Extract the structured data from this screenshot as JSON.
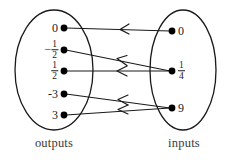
{
  "diagram": {
    "type": "mapping-diagram",
    "title": "",
    "colors": {
      "stroke": "#1a1a1a",
      "node_fill": "#000000",
      "caption": "#3a3a3a",
      "background": "#ffffff"
    },
    "sets": {
      "left": {
        "caption": "outputs",
        "ellipse": {
          "cx": 54,
          "cy": 70,
          "rx": 39,
          "ry": 60
        },
        "nodes": [
          {
            "id": "out-0",
            "label": "0",
            "is_fraction": false,
            "negative": false,
            "x": 64,
            "y": 28
          },
          {
            "id": "out-neghalf",
            "label": "-1/2",
            "is_fraction": true,
            "negative": true,
            "numerator": "1",
            "denominator": "2",
            "x": 64,
            "y": 50
          },
          {
            "id": "out-half",
            "label": "1/2",
            "is_fraction": true,
            "negative": false,
            "numerator": "1",
            "denominator": "2",
            "x": 64,
            "y": 71
          },
          {
            "id": "out-neg3",
            "label": "-3",
            "is_fraction": false,
            "negative": true,
            "x": 64,
            "y": 94
          },
          {
            "id": "out-3",
            "label": "3",
            "is_fraction": false,
            "negative": false,
            "x": 64,
            "y": 115
          }
        ]
      },
      "right": {
        "caption": "inputs",
        "ellipse": {
          "cx": 183,
          "cy": 70,
          "rx": 33,
          "ry": 60
        },
        "nodes": [
          {
            "id": "in-0",
            "label": "0",
            "is_fraction": false,
            "negative": false,
            "x": 172,
            "y": 31
          },
          {
            "id": "in-quarter",
            "label": "1/4",
            "is_fraction": true,
            "negative": false,
            "numerator": "1",
            "denominator": "4",
            "x": 172,
            "y": 71
          },
          {
            "id": "in-9",
            "label": "9",
            "is_fraction": false,
            "negative": false,
            "x": 172,
            "y": 108
          }
        ]
      }
    },
    "arrows": [
      {
        "id": "arrow-0-to-0",
        "from": "in-0",
        "to": "out-0",
        "direction": "right-to-left"
      },
      {
        "id": "arrow-quarter-to-neghalf",
        "from": "in-quarter",
        "to": "out-neghalf",
        "direction": "right-to-left"
      },
      {
        "id": "arrow-quarter-to-half",
        "from": "in-quarter",
        "to": "out-half",
        "direction": "right-to-left"
      },
      {
        "id": "arrow-9-to-neg3",
        "from": "in-9",
        "to": "out-neg3",
        "direction": "right-to-left"
      },
      {
        "id": "arrow-9-to-3",
        "from": "in-9",
        "to": "out-3",
        "direction": "right-to-left"
      }
    ]
  }
}
